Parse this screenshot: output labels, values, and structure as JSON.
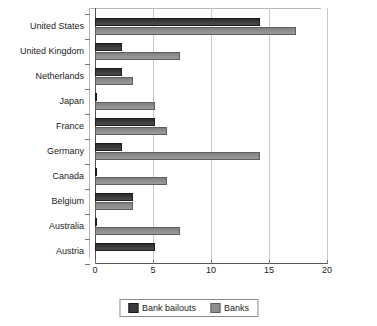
{
  "chart_data": {
    "type": "bar",
    "orientation": "horizontal",
    "title": "",
    "xlabel": "",
    "ylabel": "",
    "xlim": [
      0,
      20
    ],
    "xticks": [
      0,
      5,
      10,
      15,
      20
    ],
    "grid": true,
    "legend_position": "bottom",
    "categories": [
      "United States",
      "United Kingdom",
      "Netherlands",
      "Japan",
      "France",
      "Germany",
      "Canada",
      "Belgium",
      "Australia",
      "Austria"
    ],
    "series": [
      {
        "name": "Bank bailouts",
        "color": "#3c3c3c",
        "values": [
          14.2,
          2.3,
          2.3,
          0.2,
          5.2,
          2.3,
          0.2,
          3.3,
          0.2,
          5.2
        ]
      },
      {
        "name": "Banks",
        "color": "#8e8e8e",
        "values": [
          17.3,
          7.3,
          3.3,
          5.2,
          6.2,
          14.2,
          6.2,
          3.3,
          7.3,
          0
        ]
      }
    ]
  },
  "legend": {
    "items": [
      {
        "label": "Bank bailouts",
        "swatch": "legend-swatch-dark"
      },
      {
        "label": "Banks",
        "swatch": "legend-swatch-light"
      }
    ]
  },
  "axis": {
    "x_tick_labels": [
      "0",
      "5",
      "10",
      "15",
      "20"
    ]
  },
  "colors": {
    "series_bailouts": "#3c3c3c",
    "series_banks": "#8e8e8e",
    "axis": "#555555",
    "gridline": "#c9c9c9",
    "background": "#ffffff"
  }
}
